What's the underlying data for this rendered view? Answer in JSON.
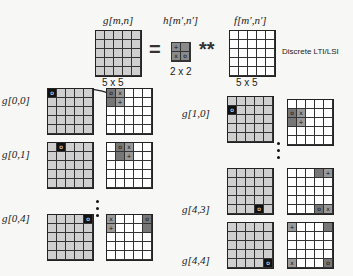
{
  "header": {
    "g_label": "g[m,n]",
    "h_label": "h[m′,n′]",
    "f_label": "f[m′,n′]",
    "g_dim": "5 x 5",
    "h_dim": "2 x 2",
    "f_dim": "5 x 5",
    "equals": "=",
    "conv_op": "**",
    "side_note": "Discrete LTI/LSI",
    "h_kernel": [
      "+",
      "",
      "x",
      "o"
    ]
  },
  "examples": [
    {
      "label": "g[0,0]",
      "out": [
        0,
        0
      ],
      "kernel": {
        "o": [
          0,
          0
        ],
        "x": [
          0,
          1
        ],
        "+": [
          1,
          1
        ],
        "d": [
          1,
          0
        ]
      }
    },
    {
      "label": "g[0,1]",
      "out": [
        0,
        1
      ],
      "kernel": {
        "o": [
          0,
          1
        ],
        "x": [
          0,
          2
        ],
        "+": [
          1,
          2
        ],
        "d": [
          1,
          1
        ]
      }
    },
    {
      "label": "g[0,4]",
      "out": [
        0,
        4
      ],
      "kernel": {
        "o": [
          0,
          4
        ],
        "x": [
          0,
          0
        ],
        "+": [
          1,
          0
        ],
        "d": [
          1,
          4
        ]
      }
    },
    {
      "label": "g[1,0]",
      "out": [
        1,
        0
      ],
      "kernel": {
        "o": [
          1,
          0
        ],
        "x": [
          1,
          1
        ],
        "+": [
          2,
          1
        ],
        "d": [
          2,
          0
        ]
      }
    },
    {
      "label": "g[4,3]",
      "out": [
        4,
        3
      ],
      "kernel": {
        "o": [
          4,
          3
        ],
        "x": [
          4,
          4
        ],
        "+": [
          0,
          4
        ],
        "d": [
          0,
          3
        ]
      }
    },
    {
      "label": "g[4,4]",
      "out": [
        4,
        4
      ],
      "kernel": {
        "o": [
          4,
          4
        ],
        "x": [
          4,
          0
        ],
        "+": [
          0,
          0
        ],
        "d": [
          0,
          4
        ]
      }
    }
  ]
}
